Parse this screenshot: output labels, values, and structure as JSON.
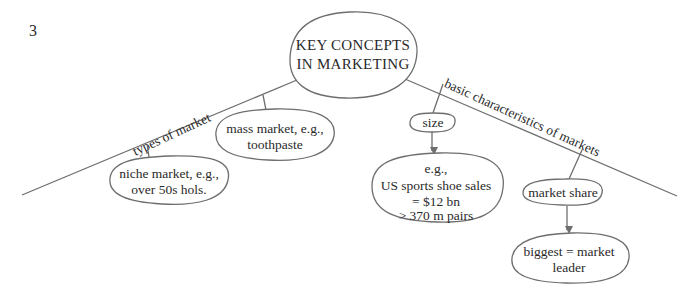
{
  "page": {
    "number": "3"
  },
  "diagram": {
    "colors": {
      "line": "#6e6e6e",
      "text": "#2a2a2a",
      "background": "#ffffff"
    },
    "center": {
      "line1": "KEY CONCEPTS",
      "line2": "IN  MARKETING"
    },
    "branches": [
      {
        "label": "types of market",
        "children": [
          {
            "lines": [
              "mass market, e.g.,",
              "toothpaste"
            ]
          },
          {
            "lines": [
              "niche market, e.g.,",
              "over 50s hols."
            ]
          }
        ]
      },
      {
        "label": "basic characteristics of markets",
        "children": [
          {
            "label": "size",
            "detail": {
              "lines": [
                "e.g.,",
                "US sports shoe sales",
                "= $12 bn",
                "> 370 m pairs"
              ]
            }
          },
          {
            "label": "market share",
            "detail": {
              "lines": [
                "biggest = market",
                "leader"
              ]
            }
          }
        ]
      }
    ]
  }
}
